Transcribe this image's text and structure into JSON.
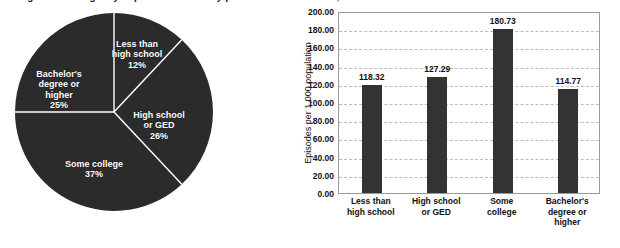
{
  "top_caption_sliver": "Figure 1. Emergency department visits by patient education level, United States",
  "chart_data": [
    {
      "type": "pie",
      "name": "education-distribution-pie",
      "title": "",
      "labels": [
        "Less than high school",
        "High school or GED",
        "Some college",
        "Bachelor's degree or higher"
      ],
      "values": [
        12,
        26,
        37,
        25
      ],
      "value_suffix": "%",
      "slice_color": "#2b2b2b",
      "separator_color": "#ffffff",
      "label_color": "#ffffff",
      "start_angle_deg": 0,
      "direction": "clockwise",
      "legend": "none",
      "slices": [
        {
          "label": "Less than\nhigh school",
          "percent_text": "12%",
          "value": 12
        },
        {
          "label": "High school\nor GED",
          "percent_text": "26%",
          "value": 26
        },
        {
          "label": "Some college",
          "percent_text": "37%",
          "value": 37
        },
        {
          "label": "Bachelor's\ndegree or\nhigher",
          "percent_text": "25%",
          "value": 25
        }
      ]
    },
    {
      "type": "bar",
      "name": "episodes-by-education-bar",
      "title": "",
      "xlabel": "",
      "ylabel": "Episodes per 1,000 population",
      "categories": [
        "Less than\nhigh school",
        "High school\nor GED",
        "Some\ncollege",
        "Bachelor's\ndegree or\nhigher"
      ],
      "values": [
        118.32,
        127.29,
        180.73,
        114.77
      ],
      "value_labels": [
        "118.32",
        "127.29",
        "180.73",
        "114.77"
      ],
      "ylim": [
        0,
        200
      ],
      "ytick_step": 20,
      "yticks": [
        200.0,
        180.0,
        160.0,
        140.0,
        120.0,
        100.0,
        80.0,
        60.0,
        40.0,
        20.0,
        0.0
      ],
      "ytick_labels": [
        "200.00",
        "180.00",
        "160.00",
        "140.00",
        "120.00",
        "100.00",
        "80.00",
        "60.00",
        "40.00",
        "20.00",
        "0.00"
      ],
      "grid": "horizontal-dashed",
      "grid_color": "#bdbdbd",
      "bar_color": "#333333",
      "plot_border_color": "#9a9a9a",
      "legend": "none"
    }
  ]
}
